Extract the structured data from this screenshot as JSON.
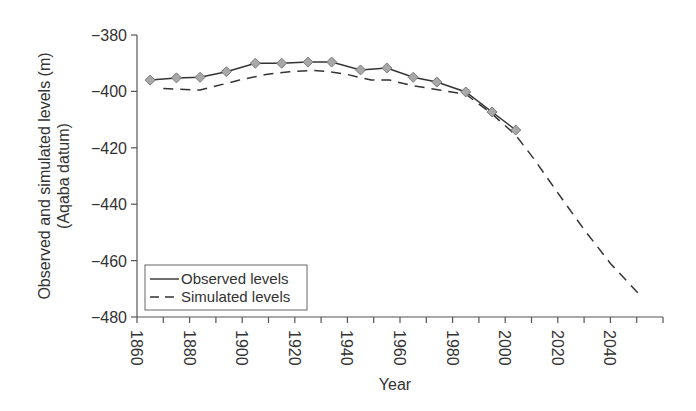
{
  "chart_data": {
    "type": "line",
    "title": "",
    "xlabel": "Year",
    "ylabel": "Observed and simulated levels (m)",
    "ylabel_line2": "(Aqaba datum)",
    "xlim": [
      1860,
      2060
    ],
    "ylim": [
      -480,
      -380
    ],
    "x_ticks": [
      1860,
      1880,
      1900,
      1920,
      1940,
      1960,
      1980,
      2000,
      2020,
      2040
    ],
    "x_tick_labels": [
      "1860",
      "1880",
      "1900",
      "1920",
      "1940",
      "1960",
      "1980",
      "2000",
      "2020",
      "2040"
    ],
    "x_minor_tick_step": 10,
    "y_ticks": [
      -380,
      -400,
      -420,
      -440,
      -460,
      -480
    ],
    "y_tick_labels": [
      "−380",
      "−400",
      "−420",
      "−440",
      "−460",
      "−480"
    ],
    "grid": false,
    "legend_position": "lower left",
    "series": [
      {
        "name": "Observed levels",
        "style": "solid",
        "marker": "diamond",
        "color": "#333333",
        "marker_fill": "#a8a8a8",
        "marker_stroke": "#7a7a7a",
        "x": [
          1865,
          1875,
          1884,
          1894,
          1905,
          1915,
          1925,
          1934,
          1945,
          1955,
          1965,
          1974,
          1985,
          1995,
          2004
        ],
        "values": [
          -396,
          -395.2,
          -395,
          -393,
          -390,
          -390,
          -389.6,
          -389.6,
          -392.4,
          -391.7,
          -395,
          -396.7,
          -400.2,
          -407.3,
          -413.7
        ]
      },
      {
        "name": "Simulated levels",
        "style": "dashed",
        "marker": "none",
        "color": "#333333",
        "x": [
          1870,
          1884,
          1899,
          1909,
          1918,
          1927,
          1933,
          1940,
          1949,
          1956,
          1965,
          1975,
          1985,
          1995,
          2004,
          2011,
          2020,
          2030,
          2040,
          2052
        ],
        "values": [
          -399,
          -399.5,
          -396,
          -394,
          -393,
          -392.5,
          -393,
          -394,
          -396,
          -396,
          -398,
          -399.5,
          -401,
          -408,
          -415.5,
          -424,
          -436,
          -449,
          -461,
          -473
        ]
      }
    ]
  },
  "legend": {
    "items": [
      {
        "label": "Observed levels",
        "style": "solid"
      },
      {
        "label": "Simulated levels",
        "style": "dashed"
      }
    ]
  },
  "plot_area": {
    "left": 137,
    "right": 663,
    "top": 35,
    "bottom": 317
  }
}
